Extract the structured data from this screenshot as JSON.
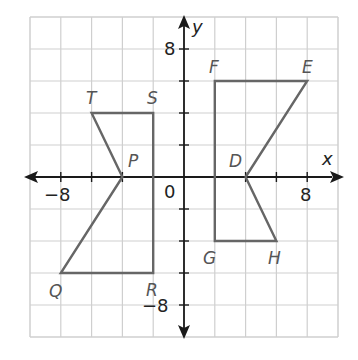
{
  "chart_data": {
    "type": "coordinate-plane",
    "xlim": [
      -10,
      10
    ],
    "ylim": [
      -10,
      10
    ],
    "grid_step": 2,
    "tick_step": 2,
    "axis_labels": {
      "x": "x",
      "y": "y"
    },
    "tick_labels": [
      {
        "axis": "x",
        "value": -8,
        "text": "−8"
      },
      {
        "axis": "x",
        "value": 8,
        "text": "8"
      },
      {
        "axis": "y",
        "value": 8,
        "text": "8"
      },
      {
        "axis": "y",
        "value": -8,
        "text": "−8"
      },
      {
        "axis": "origin",
        "value": 0,
        "text": "0"
      }
    ],
    "polygons": [
      {
        "name": "PQRST",
        "vertices": [
          {
            "label": "P",
            "x": -4,
            "y": 0
          },
          {
            "label": "Q",
            "x": -8,
            "y": -6
          },
          {
            "label": "R",
            "x": -2,
            "y": -6
          },
          {
            "label": "S",
            "x": -2,
            "y": 4
          },
          {
            "label": "T",
            "x": -6,
            "y": 4
          }
        ]
      },
      {
        "name": "DEFGH",
        "vertices": [
          {
            "label": "D",
            "x": 4,
            "y": 0
          },
          {
            "label": "E",
            "x": 8,
            "y": 6
          },
          {
            "label": "F",
            "x": 2,
            "y": 6
          },
          {
            "label": "G",
            "x": 2,
            "y": -4
          },
          {
            "label": "H",
            "x": 6,
            "y": -4
          }
        ]
      }
    ]
  },
  "labels": {
    "x_axis": "x",
    "y_axis": "y",
    "origin": "0",
    "x_neg8": "−8",
    "x_pos8": "8",
    "y_pos8": "8",
    "y_neg8": "−8",
    "P": "P",
    "Q": "Q",
    "R": "R",
    "S": "S",
    "T": "T",
    "D": "D",
    "E": "E",
    "F": "F",
    "G": "G",
    "H": "H"
  },
  "colors": {
    "grid": "#cfcfcf",
    "axis": "#1a1a1a",
    "polygon": "#666666",
    "point_label": "#555555"
  }
}
